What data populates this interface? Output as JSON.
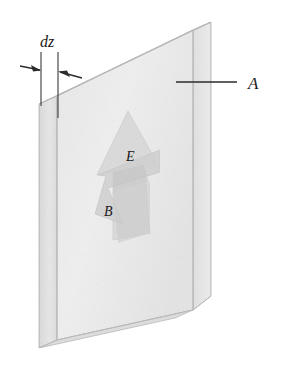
{
  "figure": {
    "labels": {
      "thickness": "dz",
      "area": "A",
      "electric_field": "E",
      "magnetic_field": "B"
    },
    "colors": {
      "background": "#ffffff",
      "front_face": "#efefef",
      "top_face": "#f8f8f8",
      "side_face": "#e4e4e4",
      "right_face": "#e8e8e8",
      "edge_stroke": "#b9b9b9",
      "arrow_e_fill": "#dcdcdc",
      "arrow_b_fill": "#d2d2d2",
      "arrow_overlap_fill": "#c6c6c6",
      "line_stroke": "#2b2b2b",
      "text": "#1a1a1a"
    },
    "annotations": {
      "dz_dimension": "double-headed dimension arrows marking slab thickness",
      "area_leader": "leader line from label A to slab front face"
    }
  }
}
